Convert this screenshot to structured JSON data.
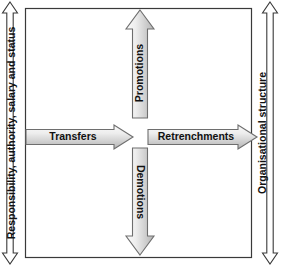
{
  "diagram": {
    "frame": {
      "name": "main-frame",
      "border_color": "#3a3a3a",
      "fill_color": "#ffffff"
    },
    "axes": [
      {
        "id": "left-axis",
        "label": "Responsibility, authority, salary and status",
        "orientation": "vertical",
        "arrow_type": "double-headed",
        "fill_color": "#ffffff",
        "border_color": "#3a3a3a"
      },
      {
        "id": "right-axis",
        "label": "Organisational structure",
        "orientation": "vertical",
        "arrow_type": "double-headed",
        "fill_color": "#ffffff",
        "border_color": "#3a3a3a"
      }
    ],
    "arrows": [
      {
        "id": "promotions-arrow",
        "label": "Promotions",
        "direction": "up",
        "fill_start": "#f2f2f2",
        "fill_end": "#b8b8b8",
        "border_color": "#6e6e6e"
      },
      {
        "id": "demotions-arrow",
        "label": "Demotions",
        "direction": "down",
        "fill_start": "#f2f2f2",
        "fill_end": "#b8b8b8",
        "border_color": "#6e6e6e"
      },
      {
        "id": "transfers-arrow",
        "label": "Transfers",
        "direction": "right",
        "fill_start": "#f2f2f2",
        "fill_end": "#b8b8b8",
        "border_color": "#6e6e6e"
      },
      {
        "id": "retrenchments-arrow",
        "label": "Retrenchments",
        "direction": "right",
        "fill_start": "#f2f2f2",
        "fill_end": "#b8b8b8",
        "border_color": "#6e6e6e"
      }
    ]
  }
}
